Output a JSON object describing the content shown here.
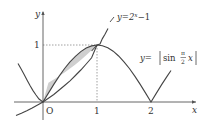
{
  "figure": {
    "type": "function-graph",
    "colors": {
      "axis": "#555555",
      "curve": "#444444",
      "shade": "#cfcfcf",
      "dashed": "#888888",
      "text": "#333333"
    },
    "axes": {
      "x_label": "x",
      "y_label": "y",
      "origin_label": "O",
      "x_ticks": [
        "1",
        "2"
      ],
      "y_ticks": [
        "1"
      ]
    },
    "curves": [
      {
        "name": "exponential",
        "equation_lhs": "y=2",
        "exponent": "x",
        "equation_rhs": "−1"
      },
      {
        "name": "abs-sine",
        "equation_lhs": "y=",
        "func": "sin",
        "frac_num": "π",
        "frac_den": "2",
        "var": "x"
      }
    ],
    "intersection_points": [
      {
        "x": 0,
        "y": 0
      },
      {
        "x": 1,
        "y": 1
      }
    ],
    "shaded_region": "between y=|sin(πx/2)| and y=2^x−1 for 0 ≤ x ≤ 1"
  }
}
